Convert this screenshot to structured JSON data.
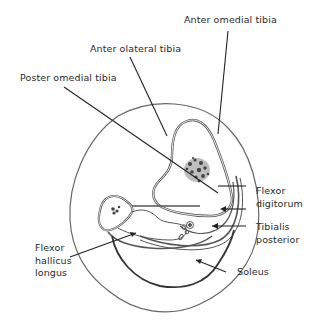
{
  "diagram": {
    "labels": {
      "anteromedial_tibia": "Anter omedial tibia",
      "anterolateral_tibia": "Anter olateral tibia",
      "posteromedial_tibia": "Poster omedial tibia",
      "flexor_digitorum_line1": "Flexor",
      "flexor_digitorum_line2": "digitorum",
      "tibialis_posterior_line1": "Tibialis",
      "tibialis_posterior_line2": "posterior",
      "flexor_hallucis_line1": "Flexor",
      "flexor_hallucis_line2": "hallicus",
      "flexor_hallucis_line3": "longus",
      "soleus": "Soleus"
    },
    "colors": {
      "outline": "#555555",
      "leader": "#222222",
      "text": "#2a2a2a",
      "marrow": "#444444"
    }
  }
}
